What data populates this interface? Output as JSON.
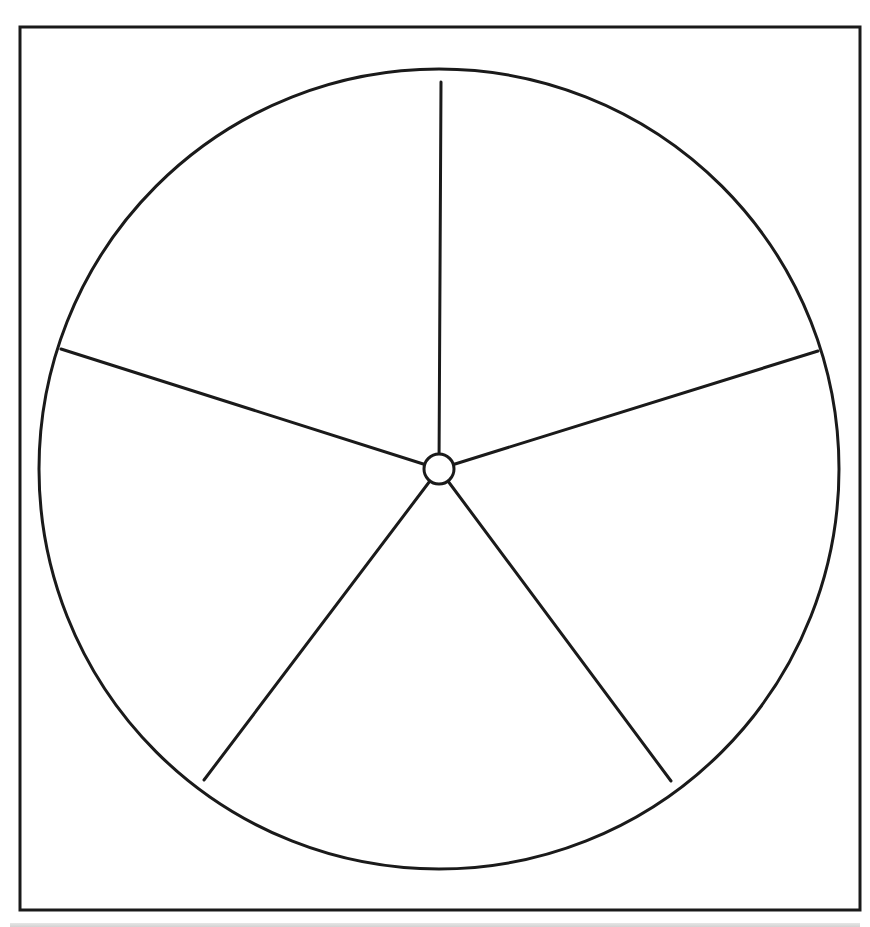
{
  "diagram": {
    "type": "pie-wheel-template",
    "sections": 5,
    "section_labels": [],
    "stroke_color": "#1a1a1a",
    "fill_color": "#ffffff",
    "frame": {
      "x": 20,
      "y": 27,
      "width": 840,
      "height": 883,
      "stroke_width": 3
    },
    "wheel": {
      "cx": 439,
      "cy": 469,
      "r": 400,
      "stroke_width": 3
    },
    "hub": {
      "cx": 439,
      "cy": 469,
      "r": 15,
      "stroke_width": 3
    },
    "spokes": [
      {
        "x": 441,
        "y": 82
      },
      {
        "x": 818,
        "y": 351
      },
      {
        "x": 671,
        "y": 781
      },
      {
        "x": 204,
        "y": 780
      },
      {
        "x": 61,
        "y": 349
      }
    ]
  }
}
